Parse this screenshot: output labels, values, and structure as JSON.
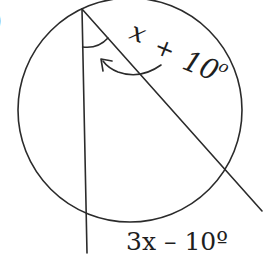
{
  "diagram": {
    "type": "circle-inscribed-angle",
    "problem_marker": ")",
    "circle": {
      "cx": 130,
      "cy": 110,
      "r": 112
    },
    "vertex": {
      "x": 82,
      "y": 9
    },
    "chords": [
      {
        "name": "vertical-chord",
        "from": [
          82,
          9
        ],
        "to": [
          87,
          253
        ]
      },
      {
        "name": "diagonal-chord",
        "from": [
          82,
          9
        ],
        "to": [
          262,
          211
        ]
      }
    ],
    "labels": {
      "inscribed_angle": {
        "var": "x",
        "plus": "+",
        "value": "10",
        "degree": "o"
      },
      "intercepted_arc": "3x – 10º"
    },
    "colors": {
      "stroke": "#2b2b2b",
      "text": "#1e1e1e",
      "background": "#ffffff"
    }
  }
}
